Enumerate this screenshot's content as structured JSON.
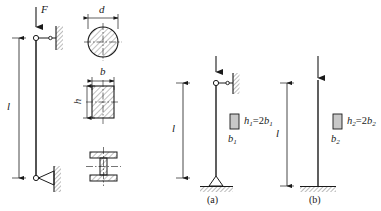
{
  "figure": {
    "title": "",
    "panels": [
      {
        "id": "left-column",
        "load_label": "F",
        "length_label": "l",
        "top_support": "pin-roller-to-wall",
        "bottom_support": "pin-to-wall",
        "cross_sections": [
          {
            "name": "circular",
            "dim_labels": [
              "d"
            ]
          },
          {
            "name": "rectangular",
            "dim_labels": [
              "b",
              "h"
            ]
          },
          {
            "name": "i-beam",
            "dim_labels": []
          }
        ]
      },
      {
        "id": "a",
        "caption": "(a)",
        "length_label": "l",
        "top_support": "pin-roller-to-wall",
        "bottom_support": "pin-on-ground",
        "section_width_label": "b",
        "section_width_sub": "1",
        "section_relation_h": "h",
        "section_relation_h_sub": "1",
        "section_relation_eq": "=2",
        "section_relation_b": "b",
        "section_relation_b_sub": "1"
      },
      {
        "id": "b",
        "caption": "(b)",
        "length_label": "l",
        "top_support": "free-loaded",
        "bottom_support": "fixed-on-ground",
        "section_width_label": "b",
        "section_width_sub": "2",
        "section_relation_h": "h",
        "section_relation_h_sub": "2",
        "section_relation_eq": "=2",
        "section_relation_b": "b",
        "section_relation_b_sub": "2"
      }
    ],
    "colors": {
      "line": "#1a1a1a",
      "hatch": "#1a1a1a",
      "fill": "#c8c8c8",
      "background": "#ffffff"
    }
  }
}
